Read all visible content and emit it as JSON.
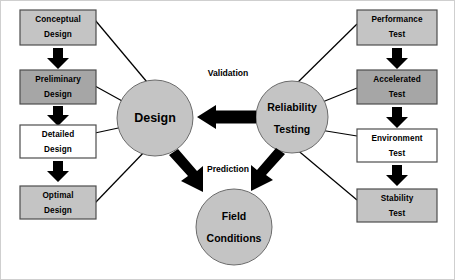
{
  "diagram": {
    "canvas": {
      "width": 455,
      "height": 280,
      "background": "#ffffff"
    },
    "colors": {
      "light_gray": "#c4c4c4",
      "mid_gray": "#a6a6a6",
      "white": "#ffffff",
      "outline": "#4d4d4d",
      "arrow": "#000000",
      "connector": "#000000",
      "text": "#000000"
    },
    "left_column": {
      "name": "design-process-stages",
      "boxes": [
        {
          "id": "conceptual-design",
          "line1": "Conceptual",
          "line2": "Design",
          "fill": "#c4c4c4"
        },
        {
          "id": "preliminary-design",
          "line1": "Preliminary",
          "line2": "Design",
          "fill": "#a6a6a6"
        },
        {
          "id": "detailed-design",
          "line1": "Detailed",
          "line2": "Design",
          "fill": "#ffffff"
        },
        {
          "id": "optimal-design",
          "line1": "Optimal",
          "line2": "Design",
          "fill": "#c4c4c4"
        }
      ]
    },
    "right_column": {
      "name": "reliability-test-stages",
      "boxes": [
        {
          "id": "performance-test",
          "line1": "Performance",
          "line2": "Test",
          "fill": "#c4c4c4"
        },
        {
          "id": "accelerated-test",
          "line1": "Accelerated",
          "line2": "Test",
          "fill": "#a6a6a6"
        },
        {
          "id": "environment-test",
          "line1": "Environment",
          "line2": "Test",
          "fill": "#ffffff"
        },
        {
          "id": "stability-test",
          "line1": "Stability",
          "line2": "Test",
          "fill": "#c4c4c4"
        }
      ]
    },
    "circles": [
      {
        "id": "design-circle",
        "label": "Design",
        "line1": "Design",
        "line2": "",
        "fill": "#c4c4c4"
      },
      {
        "id": "reliability-testing-circle",
        "label": "Reliability Testing",
        "line1": "Reliability",
        "line2": "Testing",
        "fill": "#c4c4c4"
      },
      {
        "id": "field-conditions-circle",
        "label": "Field Conditions",
        "line1": "Field",
        "line2": "Conditions",
        "fill": "#c4c4c4"
      }
    ],
    "edge_labels": [
      {
        "id": "validation-label",
        "text": "Validation"
      },
      {
        "id": "prediction-label",
        "text": "Prediction"
      }
    ],
    "relations": [
      {
        "from": "reliability-testing-circle",
        "to": "design-circle",
        "label": "Validation",
        "style": "single-arrow"
      },
      {
        "from": "design-circle",
        "to": "field-conditions-circle",
        "label": "Prediction",
        "style": "double-arrow"
      },
      {
        "from": "reliability-testing-circle",
        "to": "field-conditions-circle",
        "label": "Prediction",
        "style": "double-arrow"
      }
    ]
  }
}
